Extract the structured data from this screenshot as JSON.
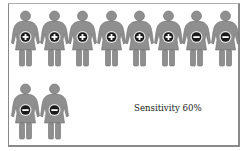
{
  "diagram": {
    "caption": "Sensitivity 60%",
    "figure_color": "#8f8f8f",
    "badge_color": "#1a1a1a",
    "rows": [
      {
        "figures": [
          {
            "result": "positive",
            "symbol": "+"
          },
          {
            "result": "positive",
            "symbol": "+"
          },
          {
            "result": "positive",
            "symbol": "+"
          },
          {
            "result": "positive",
            "symbol": "+"
          },
          {
            "result": "positive",
            "symbol": "+"
          },
          {
            "result": "positive",
            "symbol": "+"
          },
          {
            "result": "negative",
            "symbol": "−"
          },
          {
            "result": "negative",
            "symbol": "−"
          }
        ]
      },
      {
        "figures": [
          {
            "result": "negative",
            "symbol": "−"
          },
          {
            "result": "negative",
            "symbol": "−"
          }
        ]
      }
    ],
    "totals": {
      "positive": 6,
      "negative": 4,
      "total": 10,
      "sensitivity_percent": 60
    }
  }
}
